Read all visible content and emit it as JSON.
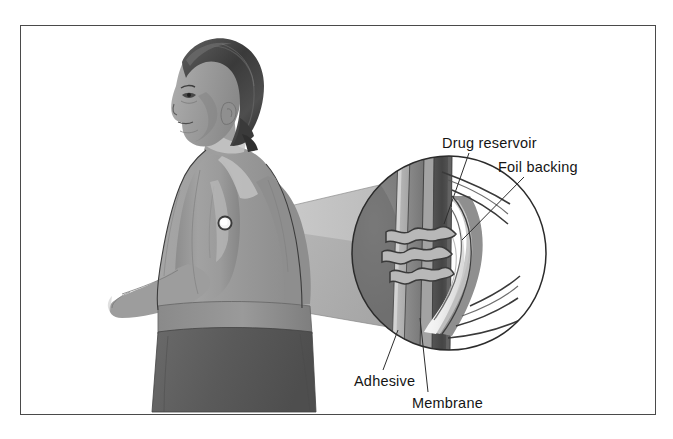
{
  "figure": {
    "border_color": "#4a4a4a",
    "background_color": "#ffffff"
  },
  "labels": [
    {
      "id": "drug-reservoir",
      "text": "Drug reservoir"
    },
    {
      "id": "foil-backing",
      "text": "Foil backing"
    },
    {
      "id": "adhesive",
      "text": "Adhesive"
    },
    {
      "id": "membrane",
      "text": "Membrane"
    }
  ],
  "label_text": {
    "drug_reservoir": "Drug reservoir",
    "foil_backing": "Foil backing",
    "adhesive": "Adhesive",
    "membrane": "Membrane"
  },
  "figure_elements": {
    "person": "man-profile-torso",
    "patch_site": "left-upper-arm",
    "magnifier": "circular-inset-cross-section",
    "cone": "magnification-cone"
  },
  "palette": {
    "skin_mid": "#9a9a9a",
    "skin_light": "#c9c9c9",
    "skin_shadow": "#7d7d7d",
    "hair_dark": "#3c3c3c",
    "hair_mid": "#5e5e5e",
    "trousers": "#5a5a5a",
    "waistband": "#8e8e8e",
    "inset_dark": "#6e6e6e",
    "foil_backing": "#4b4b4b",
    "membrane": "#8a8a8a",
    "adhesive": "#b5b5b5",
    "reservoir": "#f2f2f2",
    "outline": "#2b2b2b",
    "text": "#151515"
  }
}
